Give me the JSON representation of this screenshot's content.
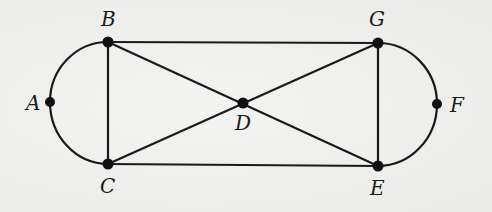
{
  "diagram": {
    "type": "graph",
    "nodes": [
      {
        "id": "A",
        "label": "A",
        "x": 50,
        "y": 102
      },
      {
        "id": "B",
        "label": "B",
        "x": 108,
        "y": 42
      },
      {
        "id": "C",
        "label": "C",
        "x": 108,
        "y": 164
      },
      {
        "id": "D",
        "label": "D",
        "x": 243,
        "y": 103
      },
      {
        "id": "E",
        "label": "E",
        "x": 378,
        "y": 166
      },
      {
        "id": "F",
        "label": "F",
        "x": 437,
        "y": 104
      },
      {
        "id": "G",
        "label": "G",
        "x": 378,
        "y": 43
      }
    ],
    "edges": [
      {
        "from": "A",
        "to": "B",
        "shape": "arc"
      },
      {
        "from": "A",
        "to": "C",
        "shape": "arc"
      },
      {
        "from": "B",
        "to": "G",
        "shape": "line"
      },
      {
        "from": "B",
        "to": "C",
        "shape": "line"
      },
      {
        "from": "B",
        "to": "D",
        "shape": "line"
      },
      {
        "from": "D",
        "to": "E",
        "shape": "line"
      },
      {
        "from": "C",
        "to": "D",
        "shape": "line"
      },
      {
        "from": "D",
        "to": "G",
        "shape": "line"
      },
      {
        "from": "C",
        "to": "E",
        "shape": "line"
      },
      {
        "from": "G",
        "to": "E",
        "shape": "line"
      },
      {
        "from": "G",
        "to": "F",
        "shape": "arc"
      },
      {
        "from": "F",
        "to": "E",
        "shape": "arc"
      }
    ],
    "labels": {
      "A": "A",
      "B": "B",
      "C": "C",
      "D": "D",
      "E": "E",
      "F": "F",
      "G": "G"
    }
  }
}
